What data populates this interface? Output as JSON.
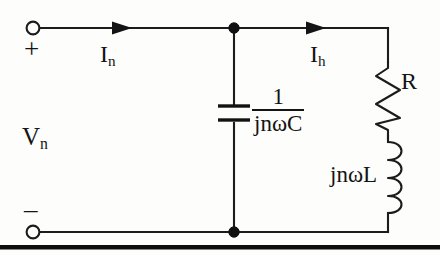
{
  "figure": {
    "background_color": "#fdfdfb",
    "ink_color": "#141414"
  },
  "labels": {
    "source_voltage": "V",
    "source_voltage_sub": "n",
    "polarity_positive": "+",
    "polarity_negative": "–",
    "current_source": "I",
    "current_source_sub": "n",
    "current_branch": "I",
    "current_branch_sub": "h",
    "resistor": "R",
    "inductor": "jnωL",
    "capacitor_numerator": "1",
    "capacitor_denominator": "jnωC"
  },
  "components": [
    {
      "name": "capacitor",
      "impedance": "1/(jnωC)",
      "orientation": "vertical",
      "connection": "shunt"
    },
    {
      "name": "resistor",
      "impedance": "R",
      "orientation": "vertical",
      "connection": "series"
    },
    {
      "name": "inductor",
      "impedance": "jnωL",
      "orientation": "vertical",
      "connection": "series"
    }
  ],
  "terminals": [
    {
      "name": "positive-terminal",
      "polarity": "+",
      "style": "open-circle"
    },
    {
      "name": "negative-terminal",
      "polarity": "–",
      "style": "open-circle"
    }
  ],
  "nodes": [
    {
      "name": "top-node",
      "style": "filled-dot"
    },
    {
      "name": "bottom-node",
      "style": "filled-dot"
    }
  ],
  "currents": [
    {
      "name": "input-current",
      "label": "In",
      "direction": "right"
    },
    {
      "name": "branch-current",
      "label": "Ih",
      "direction": "right"
    }
  ]
}
